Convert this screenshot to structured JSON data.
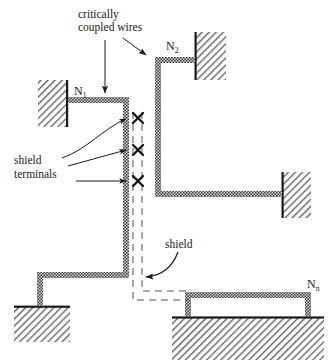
{
  "figure": {
    "type": "schematic-diagram",
    "background_color": "#ffffff",
    "ink_color": "#1a1a1a"
  },
  "annotations": {
    "coupled_wires_line1": "critically",
    "coupled_wires_line2": "coupled wires",
    "shield_terminals_line1": "shield",
    "shield_terminals_line2": "terminals",
    "shield_label": "shield"
  },
  "nodes": [
    {
      "id": "n1",
      "letter": "N",
      "subscript": "1"
    },
    {
      "id": "n2",
      "letter": "N",
      "subscript": "2"
    },
    {
      "id": "nn",
      "letter": "N",
      "subscript": "n"
    }
  ],
  "elements": {
    "wire_fill_color": "#6b6b6b",
    "wire_outline_color": "#1a1a1a",
    "hatch_color": "#4a4a4a",
    "shield_dash_color": "#555555",
    "terminal_marker": "x",
    "terminal_count": 3
  },
  "geometry": {
    "wire_thickness": 6,
    "shield_line_gap": 9,
    "canvas_width": 336,
    "canvas_height": 364
  }
}
